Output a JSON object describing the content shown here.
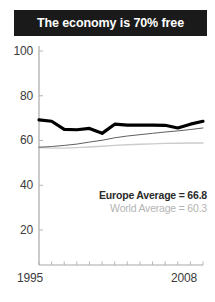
{
  "title": {
    "text": "The economy is 70% free",
    "background": "#1a1a1a",
    "color": "#ffffff"
  },
  "legend": {
    "europe": "Europe Average = 66.8",
    "world": "World Average = 60.3",
    "europe_color": "#2b2b2b",
    "world_color": "#b4b4b4"
  },
  "axis": {
    "y_ticks": [
      "100",
      "80",
      "60",
      "40",
      "20"
    ],
    "x_start": "1995",
    "x_end": "2008",
    "axis_color": "#9a9a9a",
    "tick_text_color": "#3b3b3b"
  },
  "chart_data": {
    "type": "line",
    "title": "The economy is 70% free",
    "xlabel": "",
    "ylabel": "",
    "xlim": [
      1995,
      2008
    ],
    "ylim": [
      0,
      100
    ],
    "grid": false,
    "legend_position": "inside-bottom-right",
    "x": [
      1995,
      1996,
      1997,
      1998,
      1999,
      2000,
      2001,
      2002,
      2003,
      2004,
      2005,
      2006,
      2007,
      2008
    ],
    "xtick_labels": [
      "1995",
      "2008"
    ],
    "ytick_values": [
      20,
      40,
      60,
      80,
      100
    ],
    "series": [
      {
        "name": "Europe Average",
        "color": "#000000",
        "width": 3.2,
        "annotation": "Europe Average = 66.8",
        "values": [
          69.2,
          68.6,
          65.0,
          64.8,
          65.4,
          63.2,
          67.3,
          66.9,
          66.9,
          66.9,
          66.8,
          65.6,
          67.3,
          68.6
        ]
      },
      {
        "name": "Europe (unlabeled trend)",
        "color": "#4d4d4d",
        "width": 0.9,
        "annotation": "",
        "values": [
          57.0,
          57.3,
          57.8,
          58.4,
          59.3,
          60.1,
          61.2,
          62.0,
          62.6,
          63.2,
          63.8,
          64.3,
          64.9,
          65.6
        ]
      },
      {
        "name": "World Average",
        "color": "#cccccc",
        "width": 1.4,
        "annotation": "World Average = 60.3",
        "values": [
          56.8,
          56.6,
          56.6,
          56.8,
          57.1,
          57.4,
          57.8,
          58.1,
          58.3,
          58.5,
          58.7,
          58.8,
          58.9,
          58.9
        ]
      }
    ]
  },
  "geometry": {
    "plot_left": 39,
    "plot_right": 203,
    "plot_top": 44,
    "plot_bottom": 265,
    "y_pixel_for": {
      "100": 51,
      "80": 96,
      "60": 140.5,
      "40": 185,
      "20": 230
    }
  }
}
